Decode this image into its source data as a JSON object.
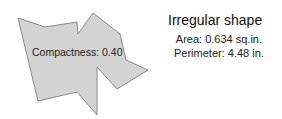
{
  "shape": {
    "fill_color": "#d3d3d3",
    "stroke_color": "#8a8a8a",
    "label": "Compactness: 0.40"
  },
  "panel": {
    "title": "Irregular shape",
    "area": "Area: 0.634 sq.in.",
    "perimeter": "Perimeter: 4.48 in."
  }
}
